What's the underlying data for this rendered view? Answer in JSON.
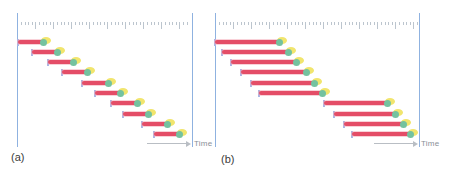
{
  "figure": {
    "background": "#ffffff",
    "colors": {
      "frame_line": "#8fb2e0",
      "ruler_tick": "#bcc5ce",
      "bar_fill": "#e44d67",
      "bar_outline": "#f3a9b5",
      "start_tick": "#a9b6e6",
      "marker_green": "#74c29f",
      "marker_yellow": "#f1e56d",
      "arrow": "#b9bec4",
      "time_text": "#8a9097",
      "label_text": "#3a3a3a"
    },
    "panels": [
      {
        "label": "(a)",
        "time_label": "Time",
        "frame": {
          "x_left": 17,
          "x_right": 192,
          "y_top": 13,
          "y_bottom": 147
        },
        "ruler": {
          "x_start": 21,
          "x_end": 189,
          "y": 22,
          "step": 3.6,
          "major_every": 5,
          "minor_h": 3,
          "major_h": 7
        },
        "arrow": {
          "x_start": 147,
          "x_end": 190,
          "y": 143
        },
        "time_label_pos": {
          "x": 194,
          "y": 139
        },
        "label_pos": {
          "x": 11,
          "y": 151
        },
        "bars": [
          {
            "y": 42,
            "start": 18,
            "end": 43
          },
          {
            "y": 52,
            "start": 32,
            "end": 57
          },
          {
            "y": 62,
            "start": 48,
            "end": 73
          },
          {
            "y": 72,
            "start": 62,
            "end": 87
          },
          {
            "y": 83,
            "start": 82,
            "end": 108
          },
          {
            "y": 93,
            "start": 95,
            "end": 120
          },
          {
            "y": 103,
            "start": 111,
            "end": 137
          },
          {
            "y": 114,
            "start": 123,
            "end": 148
          },
          {
            "y": 124,
            "start": 142,
            "end": 167
          },
          {
            "y": 134,
            "start": 154,
            "end": 179
          }
        ]
      },
      {
        "label": "(b)",
        "time_label": "Time",
        "frame": {
          "x_left": 215,
          "x_right": 419,
          "y_top": 13,
          "y_bottom": 147
        },
        "ruler": {
          "x_start": 219,
          "x_end": 417,
          "y": 22,
          "step": 3.6,
          "major_every": 5,
          "minor_h": 3,
          "major_h": 7
        },
        "arrow": {
          "x_start": 374,
          "x_end": 417,
          "y": 143
        },
        "time_label_pos": {
          "x": 421,
          "y": 139
        },
        "label_pos": {
          "x": 221,
          "y": 153
        },
        "bars": [
          {
            "y": 42,
            "start": 215,
            "end": 279
          },
          {
            "y": 52,
            "start": 222,
            "end": 288
          },
          {
            "y": 62,
            "start": 231,
            "end": 296
          },
          {
            "y": 72,
            "start": 241,
            "end": 306
          },
          {
            "y": 83,
            "start": 251,
            "end": 314
          },
          {
            "y": 93,
            "start": 259,
            "end": 322
          },
          {
            "y": 103,
            "start": 324,
            "end": 387
          },
          {
            "y": 114,
            "start": 334,
            "end": 395
          },
          {
            "y": 124,
            "start": 344,
            "end": 403
          },
          {
            "y": 134,
            "start": 352,
            "end": 410
          }
        ]
      }
    ]
  }
}
